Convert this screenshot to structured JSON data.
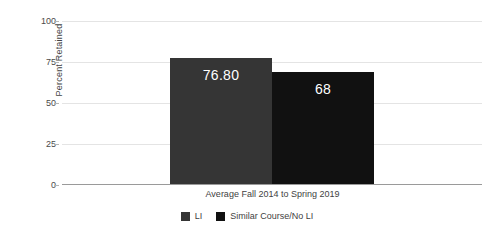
{
  "chart_data": {
    "type": "bar",
    "title": "",
    "xlabel": "Average Fall 2014 to Spring 2019",
    "ylabel": "Percent Retained",
    "categories": [
      "Average Fall 2014 to Spring 2019"
    ],
    "ylim": [
      0,
      100
    ],
    "yticks": [
      0,
      25,
      50,
      75,
      100
    ],
    "ytick_labels": [
      "0",
      "25",
      "50",
      "75",
      "100"
    ],
    "grid": true,
    "legend_position": "bottom",
    "series": [
      {
        "name": "LI",
        "values": [
          76.8
        ],
        "data_labels": [
          "76.80"
        ],
        "color": "#353535"
      },
      {
        "name": "Similar Course/No LI",
        "values": [
          68
        ],
        "data_labels": [
          "68"
        ],
        "color": "#111111"
      }
    ]
  },
  "legend": {
    "items": [
      {
        "label": "LI",
        "color": "#353535"
      },
      {
        "label": "Similar Course/No LI",
        "color": "#111111"
      }
    ]
  },
  "colors": {
    "gridline": "#e4e4e4",
    "axis": "#9a9a9a",
    "tick_text": "#4a4a4a",
    "label_text": "#3f3f3f",
    "value_text": "#ffffff",
    "background": "#ffffff"
  }
}
